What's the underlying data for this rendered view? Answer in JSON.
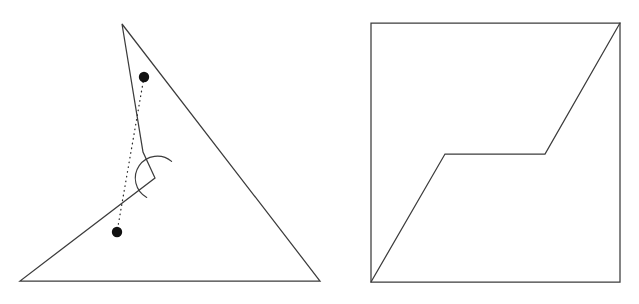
{
  "document": {
    "title": "Two geometric figures",
    "background_color": "#ffffff",
    "stroke_color": "#3c3c3c",
    "dot_color": "#111111",
    "width": 639,
    "height": 304
  },
  "chart_data": {
    "type": "diagram",
    "xlabel": "",
    "ylabel": "",
    "figures": [
      {
        "name": "left-figure",
        "label": "Non-convex polygon with notch",
        "polygon_points": "122,24 320,281 20,281 155,178 143,152",
        "vertices": [
          {
            "name": "apex",
            "x": 122,
            "y": 24
          },
          {
            "name": "bottom-right",
            "x": 320,
            "y": 281
          },
          {
            "name": "bottom-left",
            "x": 20,
            "y": 281
          },
          {
            "name": "reflex-notch",
            "x": 155,
            "y": 178
          },
          {
            "name": "notch-upper",
            "x": 143,
            "y": 152
          }
        ],
        "reflex_arc": {
          "name": "reflex-angle-arc",
          "center_x": 157,
          "center_y": 178,
          "radius": 22,
          "path": "M 146.7 197.4 A 22 22 0 1 1 171.6 161.4"
        },
        "marked_points": [
          {
            "name": "upper-point",
            "x": 144,
            "y": 77,
            "r": 5.2
          },
          {
            "name": "lower-point",
            "x": 117,
            "y": 232,
            "r": 5.2
          }
        ],
        "connector": {
          "name": "dotted-segment",
          "x1": 144,
          "y1": 77,
          "x2": 117,
          "y2": 232,
          "style": "dotted"
        }
      },
      {
        "name": "right-figure",
        "label": "Square with staircase polyline",
        "square_points": "371,23 620,23 620,282 371,282",
        "square_bounds": {
          "left": 371,
          "top": 23,
          "right": 620,
          "bottom": 282
        },
        "polyline_points": "371,282 445,154 545,154 620,23",
        "polyline_vertices": [
          {
            "name": "start-bottom-left",
            "x": 371,
            "y": 282
          },
          {
            "name": "left-knee",
            "x": 445,
            "y": 154
          },
          {
            "name": "right-knee",
            "x": 545,
            "y": 154
          },
          {
            "name": "end-top-right",
            "x": 620,
            "y": 23
          }
        ]
      }
    ]
  }
}
